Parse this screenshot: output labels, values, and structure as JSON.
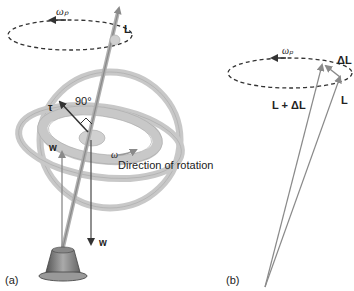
{
  "diagram": {
    "panel_a": {
      "label": "(a)",
      "precession_symbol": "ωₚ",
      "angular_momentum_label": "L",
      "torque_label": "τ",
      "angle_label": "90°",
      "weight_label_up": "w",
      "weight_label_down": "w",
      "spin_symbol": "ω",
      "spin_caption": "Direction of rotation"
    },
    "panel_b": {
      "label": "(b)",
      "precession_symbol": "ωₚ",
      "delta_label": "ΔL",
      "sum_label": "L + ΔL",
      "angular_momentum_label": "L"
    },
    "colors": {
      "ring": "#c8c8c8",
      "ring_edge": "#a8a8a8",
      "arrow": "#8a8a8a",
      "dark_arrow": "#444444",
      "dashed": "#333333",
      "base": "#888888"
    }
  }
}
